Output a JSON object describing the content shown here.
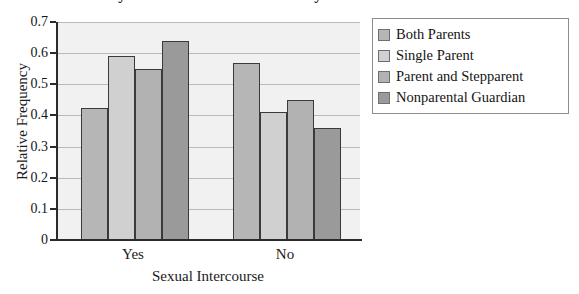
{
  "chart_data": {
    "type": "bar",
    "title": "Family Structure and Sexual Activity",
    "xlabel": "Sexual Intercourse",
    "ylabel": "Relative Frequency",
    "categories": [
      "Yes",
      "No"
    ],
    "series": [
      {
        "name": "Both Parents",
        "color": "#b6b6b6",
        "values": [
          0.425,
          0.57
        ]
      },
      {
        "name": "Single Parent",
        "color": "#d0d0d0",
        "values": [
          0.59,
          0.41
        ]
      },
      {
        "name": "Parent and Stepparent",
        "color": "#b2b2b2",
        "values": [
          0.55,
          0.45
        ]
      },
      {
        "name": "Nonparental Guardian",
        "color": "#9a9a9a",
        "values": [
          0.64,
          0.36
        ]
      }
    ],
    "ylim": [
      0,
      0.7
    ],
    "ytick_labels": [
      "0",
      "0.1",
      "0.2",
      "0.3",
      "0.4",
      "0.5",
      "0.6",
      "0.7"
    ],
    "ytick_values": [
      0,
      0.1,
      0.2,
      0.3,
      0.4,
      0.5,
      0.6,
      0.7
    ],
    "grid": true,
    "legend_position": "right",
    "plot_background": "#f1f1f1",
    "axis_color": "#2b2b2b",
    "gridline_color": "#b9b9b9"
  }
}
